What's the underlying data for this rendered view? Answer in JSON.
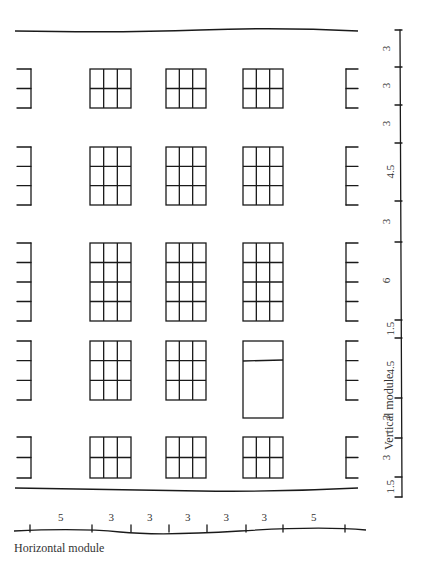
{
  "figure": {
    "caption_horizontal": "Horizontal module",
    "caption_vertical": "Vertical module"
  },
  "horizontal_module": {
    "labels": [
      "5",
      "3",
      "3",
      "3",
      "3",
      "3",
      "5"
    ],
    "tick_x": [
      30,
      92,
      131,
      169,
      207,
      246,
      283,
      345
    ],
    "baseline_y": 531
  },
  "vertical_module": {
    "labels": [
      "3",
      "3",
      "3",
      "4.5",
      "3",
      "6",
      "1.5",
      "4.5",
      "3",
      "3",
      "1.5"
    ],
    "tick_y": [
      30,
      67,
      105,
      143,
      201,
      242,
      320,
      338,
      398,
      438,
      477,
      497
    ],
    "axis_x": 401
  },
  "facade": {
    "top_line_y": 31,
    "bottom_line_y": 498,
    "window_columns_x": [
      [
        90,
        131
      ],
      [
        166,
        206
      ],
      [
        243,
        283
      ]
    ],
    "rows": [
      {
        "y": [
          69,
          108
        ],
        "panes_v": 2
      },
      {
        "y": [
          147,
          205
        ],
        "panes_v": 3
      },
      {
        "y": [
          243,
          321
        ],
        "panes_v": 4
      },
      {
        "y": [
          341,
          400
        ],
        "panes_v": 3,
        "third_column_door": true
      },
      {
        "y": [
          437,
          478
        ],
        "panes_v": 2
      }
    ]
  }
}
